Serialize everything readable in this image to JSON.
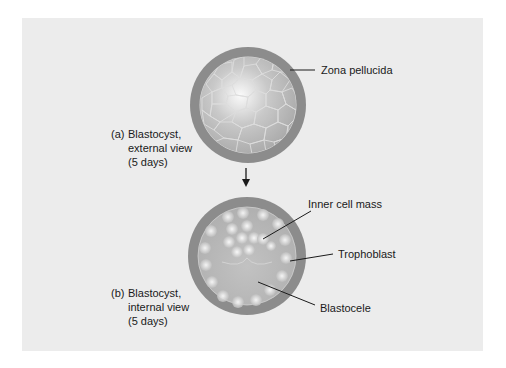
{
  "figure": {
    "panel_color": "#ececec",
    "zona_color": "#8c8c8c",
    "arrow": "down-arrow"
  },
  "captions": {
    "a": {
      "letter": "(a)",
      "lines": [
        "Blastocyst,",
        "external view",
        "(5 days)"
      ]
    },
    "b": {
      "letter": "(b)",
      "lines": [
        "Blastocyst,",
        "internal view",
        "(5 days)"
      ]
    }
  },
  "labels": {
    "zona_pellucida": "Zona pellucida",
    "inner_cell_mass": "Inner cell mass",
    "trophoblast": "Trophoblast",
    "blastocele": "Blastocele"
  }
}
